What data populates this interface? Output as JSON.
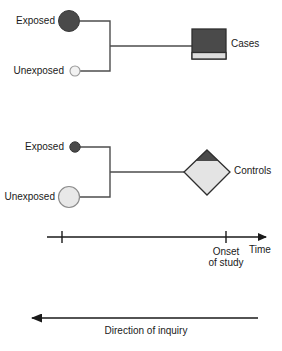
{
  "figure": {
    "type": "case-control-study-design-diagram",
    "title": ""
  },
  "groups": [
    {
      "id": "cases-group",
      "exposed_label": "Exposed",
      "unexposed_label": "Unexposed",
      "outcome_label": "Cases",
      "outcome_shape": "square",
      "exposed_marker": {
        "shape": "circle",
        "size": "large",
        "fill": "#4a4a4a"
      },
      "unexposed_marker": {
        "shape": "circle",
        "size": "small",
        "fill": "#f2f2f2"
      }
    },
    {
      "id": "controls-group",
      "exposed_label": "Exposed",
      "unexposed_label": "Unexposed",
      "outcome_label": "Controls",
      "outcome_shape": "diamond",
      "exposed_marker": {
        "shape": "circle",
        "size": "small",
        "fill": "#4a4a4a"
      },
      "unexposed_marker": {
        "shape": "circle",
        "size": "large",
        "fill": "#e8e8e8"
      }
    }
  ],
  "time_axis": {
    "label": "Time",
    "onset_line1": "Onset",
    "onset_line2": "of study",
    "ticks": 2,
    "arrow_direction": "right"
  },
  "inquiry_axis": {
    "label": "Direction of inquiry",
    "arrow_direction": "left"
  },
  "colors": {
    "dark_fill": "#4a4a4a",
    "light_fill": "#e8e8e8",
    "pale_fill": "#f2f2f2",
    "stroke": "#4d4d4d",
    "axis": "#1a1a1a",
    "text": "#1a1a1a"
  }
}
